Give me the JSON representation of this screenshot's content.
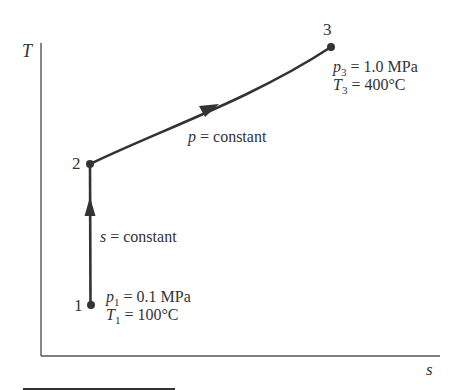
{
  "diagram": {
    "type": "T-s process diagram",
    "axes": {
      "y_label": "T",
      "x_label": "s"
    },
    "states": [
      {
        "id": "1",
        "label": "1",
        "pressure_symbol": "p",
        "pressure_sub": "1",
        "pressure_value": "= 0.1 MPa",
        "temp_symbol": "T",
        "temp_sub": "1",
        "temp_value": "= 100°C"
      },
      {
        "id": "2",
        "label": "2"
      },
      {
        "id": "3",
        "label": "3",
        "pressure_symbol": "p",
        "pressure_sub": "3",
        "pressure_value": "= 1.0 MPa",
        "temp_symbol": "T",
        "temp_sub": "3",
        "temp_value": "= 400°C"
      }
    ],
    "processes": [
      {
        "from": "1",
        "to": "2",
        "var": "s",
        "text": " = constant"
      },
      {
        "from": "2",
        "to": "3",
        "var": "p",
        "text": " = constant"
      }
    ],
    "colors": {
      "line": "#333333",
      "axis": "#555555",
      "text": "#333333"
    }
  }
}
